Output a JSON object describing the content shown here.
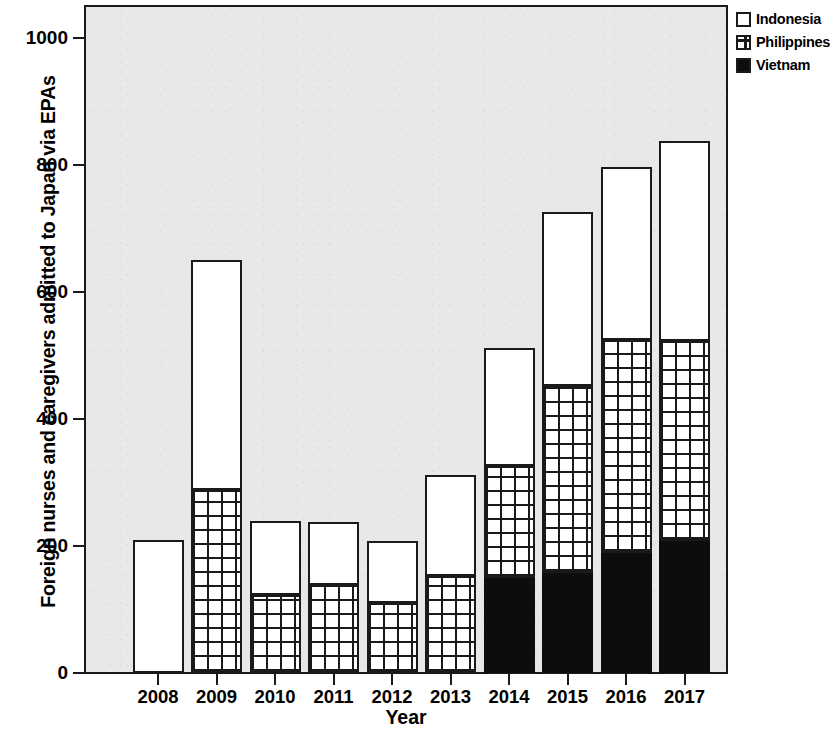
{
  "chart_data": {
    "type": "bar",
    "stacked": true,
    "title": "",
    "xlabel": "Year",
    "ylabel": "Foreign nurses and caregivers admitted to Japan via EPAs",
    "categories": [
      "2008",
      "2009",
      "2010",
      "2011",
      "2012",
      "2013",
      "2014",
      "2015",
      "2016",
      "2017"
    ],
    "ylim": [
      0,
      1060
    ],
    "yticks": [
      0,
      200,
      400,
      600,
      800,
      1000
    ],
    "ytick_labels": [
      "0",
      "200",
      "400",
      "600",
      "800",
      "1000"
    ],
    "grid": false,
    "legend_position": "top-right",
    "series": [
      {
        "name": "Vietnam",
        "color": "#0d0d0d",
        "pattern": "solid",
        "values": [
          0,
          0,
          0,
          0,
          0,
          0,
          150,
          157,
          189,
          208
        ]
      },
      {
        "name": "Philippines",
        "color": "#ffffff",
        "pattern": "grid",
        "values": [
          0,
          288,
          123,
          139,
          110,
          153,
          176,
          295,
          335,
          315
        ]
      },
      {
        "name": "Indonesia",
        "color": "#ffffff",
        "pattern": "plain",
        "values": [
          209,
          362,
          116,
          99,
          98,
          159,
          186,
          274,
          273,
          315
        ]
      }
    ],
    "totals": [
      209,
      650,
      239,
      238,
      208,
      312,
      512,
      726,
      797,
      838
    ],
    "legend": [
      "Indonesia",
      "Philippines",
      "Vietnam"
    ]
  },
  "plot": {
    "background_color": "#e8e8e8",
    "frame_color": "#1a1a1a"
  }
}
